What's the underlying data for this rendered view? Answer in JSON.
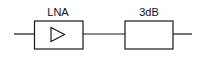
{
  "diagram": {
    "type": "block-diagram",
    "blocks": [
      {
        "id": "lna",
        "label": "LNA",
        "symbol": "amplifier-triangle-icon"
      },
      {
        "id": "attenuator",
        "label": "3dB",
        "symbol": ""
      }
    ],
    "connections": [
      {
        "from": "input",
        "to": "lna"
      },
      {
        "from": "lna",
        "to": "attenuator"
      },
      {
        "from": "attenuator",
        "to": "output"
      }
    ],
    "colors": {
      "stroke": "#1a1a1a",
      "background": "#ffffff"
    }
  }
}
